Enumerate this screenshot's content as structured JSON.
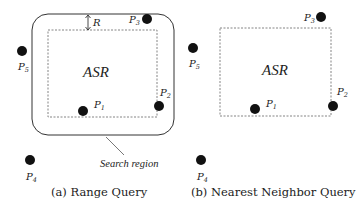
{
  "panels": [
    {
      "id": "a",
      "caption": "(a) Range Query",
      "region_label": "ASR",
      "radius_label": "R",
      "search_region_label": "Search region",
      "points": [
        {
          "name": "P",
          "sub": "1",
          "x": 83,
          "y": 111
        },
        {
          "name": "P",
          "sub": "2",
          "x": 159,
          "y": 106
        },
        {
          "name": "P",
          "sub": "3",
          "x": 147,
          "y": 19
        },
        {
          "name": "P",
          "sub": "4",
          "x": 30,
          "y": 160
        },
        {
          "name": "P",
          "sub": "5",
          "x": 22,
          "y": 51
        }
      ]
    },
    {
      "id": "b",
      "caption": "(b) Nearest Neighbor Query",
      "region_label": "ASR",
      "points": [
        {
          "name": "P",
          "sub": "1",
          "x": 255,
          "y": 109
        },
        {
          "name": "P",
          "sub": "2",
          "x": 333,
          "y": 106
        },
        {
          "name": "P",
          "sub": "3",
          "x": 321,
          "y": 17
        },
        {
          "name": "P",
          "sub": "4",
          "x": 201,
          "y": 160
        },
        {
          "name": "P",
          "sub": "5",
          "x": 193,
          "y": 48
        }
      ]
    }
  ],
  "colors": {
    "stroke": "#333333",
    "dashed": "#777777",
    "point": "#111111",
    "text": "#222222"
  }
}
